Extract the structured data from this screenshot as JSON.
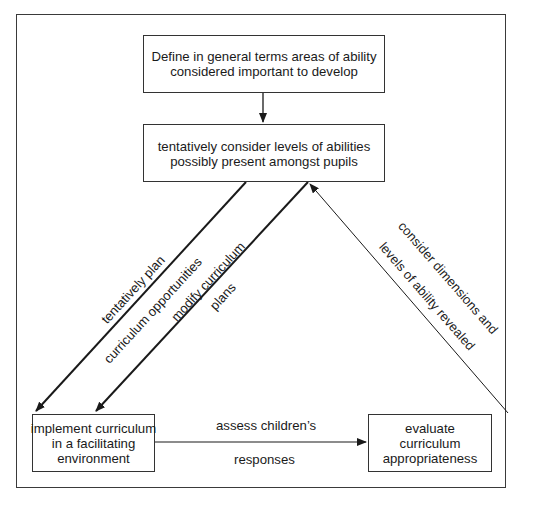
{
  "diagram": {
    "boxes": {
      "define": {
        "lines": [
          "Define in general terms areas of ability",
          "considered important to develop"
        ]
      },
      "consider_levels": {
        "lines": [
          "tentatively consider levels of abilities",
          "possibly present amongst pupils"
        ]
      },
      "implement": {
        "lines": [
          "implement curriculum",
          "in a facilitating",
          "environment"
        ]
      },
      "evaluate": {
        "lines": [
          "evaluate",
          "curriculum",
          "appropriateness"
        ]
      }
    },
    "edges": {
      "plan": {
        "line1": "tentatively plan",
        "line2": "curriculum opportunities"
      },
      "modify": {
        "line1": "modify curriculum",
        "line2": "plans"
      },
      "assess": {
        "line1": "assess children’s",
        "line2": "responses"
      },
      "reveal": {
        "line1": "consider dimensions and",
        "line2": "levels of ability revealed"
      }
    },
    "colors": {
      "stroke": "#1a1a1a",
      "frame": "#3a3a3a",
      "background": "#ffffff"
    }
  }
}
